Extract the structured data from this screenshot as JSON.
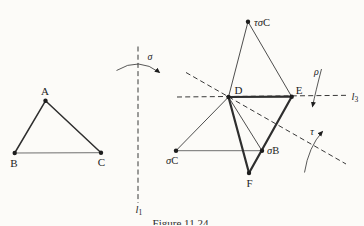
{
  "caption": "Figure 11.24",
  "colors": {
    "paper": "#fcfbf8",
    "ink": "#1d1d1d",
    "line": "#2e2e2e",
    "light_line": "#5f5f5f"
  },
  "diagram": {
    "dot_radius": 2.2,
    "points": [
      {
        "id": "A",
        "x": 45.5,
        "y": 100.8
      },
      {
        "id": "B",
        "x": 14.7,
        "y": 153.0
      },
      {
        "id": "C",
        "x": 101.0,
        "y": 152.7
      },
      {
        "id": "D",
        "x": 228.5,
        "y": 97.0
      },
      {
        "id": "E",
        "x": 291.7,
        "y": 96.7
      },
      {
        "id": "F",
        "x": 249.0,
        "y": 173.0
      },
      {
        "id": "sigma-C",
        "x": 176.0,
        "y": 150.7
      },
      {
        "id": "sigma-B",
        "x": 262.0,
        "y": 150.7
      },
      {
        "id": "tau-sigma-C",
        "x": 248.0,
        "y": 21.7
      }
    ],
    "edges": [
      {
        "from": "B",
        "to": "C",
        "w": 0.9,
        "light": true
      },
      {
        "from": "A",
        "to": "B",
        "w": 1.5
      },
      {
        "from": "A",
        "to": "C",
        "w": 1.5
      },
      {
        "from": "sigma-C",
        "to": "sigma-B",
        "w": 0.9,
        "light": true
      },
      {
        "from": "tau-sigma-C",
        "to": "D",
        "w": 0.85
      },
      {
        "from": "tau-sigma-C",
        "to": "E",
        "w": 0.85
      },
      {
        "from": "sigma-C",
        "to": "D",
        "w": 0.85
      },
      {
        "from": "D",
        "to": "sigma-B",
        "w": 0.85
      },
      {
        "from": "D",
        "to": "E",
        "w": 2.2
      },
      {
        "from": "E",
        "to": "F",
        "w": 2.2
      },
      {
        "from": "D",
        "to": "F",
        "w": 2.2
      }
    ],
    "dashed_lines": [
      {
        "id": "l1",
        "x1": 138.0,
        "y1": 46.5,
        "x2": 138.0,
        "y2": 203.0
      },
      {
        "id": "l3",
        "x1": 177.0,
        "y1": 97.0,
        "x2": 349.0,
        "y2": 95.3
      },
      {
        "id": "l2",
        "x1": 186.0,
        "y1": 72.5,
        "x2": 346.0,
        "y2": 164.0
      }
    ],
    "arrows": [
      {
        "id": "sigma-arrow",
        "d": "M 116.5 70.5 Q 139 56.5 159.5 72.5"
      },
      {
        "id": "rho-arrow",
        "d": "M 321.5 69 Q 315.5 92 312.5 106.5"
      },
      {
        "id": "tau-arrow",
        "d": "M 304.5 172.5 Q 308.5 147 322.5 131.5"
      }
    ],
    "labels": [
      {
        "id": "label-A",
        "x": 45.0,
        "y": 94.5,
        "anchor": "middle",
        "size": 11,
        "parts": [
          {
            "t": "A"
          }
        ]
      },
      {
        "id": "label-B",
        "x": 13.8,
        "y": 166.5,
        "anchor": "middle",
        "size": 11,
        "parts": [
          {
            "t": "B"
          }
        ]
      },
      {
        "id": "label-C",
        "x": 101.5,
        "y": 166.0,
        "anchor": "middle",
        "size": 11,
        "parts": [
          {
            "t": "C"
          }
        ]
      },
      {
        "id": "label-sigma",
        "x": 150.0,
        "y": 60.0,
        "anchor": "middle",
        "size": 10,
        "parts": [
          {
            "t": "σ",
            "i": true
          }
        ]
      },
      {
        "id": "label-l1",
        "x": 135.5,
        "y": 212.5,
        "anchor": "start",
        "size": 10.5,
        "parts": [
          {
            "t": "l",
            "i": true
          },
          {
            "t": "1",
            "sub": true
          }
        ]
      },
      {
        "id": "label-tau-sigma-C",
        "x": 254.0,
        "y": 25.5,
        "anchor": "start",
        "size": 10.5,
        "parts": [
          {
            "t": "τσ",
            "i": true
          },
          {
            "t": "C"
          }
        ]
      },
      {
        "id": "label-D",
        "x": 238.5,
        "y": 94.0,
        "anchor": "middle",
        "size": 11,
        "parts": [
          {
            "t": "D"
          }
        ]
      },
      {
        "id": "label-E",
        "x": 299.0,
        "y": 93.5,
        "anchor": "middle",
        "size": 11,
        "parts": [
          {
            "t": "E"
          }
        ]
      },
      {
        "id": "label-rho",
        "x": 316.5,
        "y": 75.0,
        "anchor": "middle",
        "size": 10,
        "parts": [
          {
            "t": "ρ",
            "i": true
          }
        ]
      },
      {
        "id": "label-l3",
        "x": 351.5,
        "y": 99.5,
        "anchor": "start",
        "size": 10.5,
        "parts": [
          {
            "t": "l",
            "i": true
          },
          {
            "t": "3",
            "sub": true
          }
        ]
      },
      {
        "id": "label-sigma-C",
        "x": 166.0,
        "y": 163.5,
        "anchor": "start",
        "size": 10.5,
        "parts": [
          {
            "t": "σ",
            "i": true
          },
          {
            "t": "C"
          }
        ]
      },
      {
        "id": "label-sigma-B",
        "x": 267.0,
        "y": 154.0,
        "anchor": "start",
        "size": 10.5,
        "parts": [
          {
            "t": "σ",
            "i": true
          },
          {
            "t": "B"
          }
        ]
      },
      {
        "id": "label-F",
        "x": 249.5,
        "y": 187.0,
        "anchor": "middle",
        "size": 11,
        "parts": [
          {
            "t": "F"
          }
        ]
      },
      {
        "id": "label-tau",
        "x": 312.0,
        "y": 134.5,
        "anchor": "middle",
        "size": 10,
        "parts": [
          {
            "t": "τ",
            "i": true
          }
        ]
      }
    ]
  }
}
